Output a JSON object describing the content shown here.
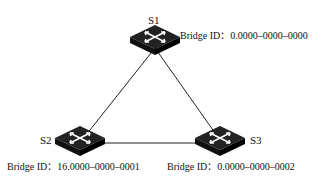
{
  "diagram": {
    "type": "network-topology",
    "switches": [
      {
        "name": "S1",
        "bridge_id_label": "Bridge ID：",
        "bridge_id": "0.0000–0000–0000"
      },
      {
        "name": "S2",
        "bridge_id_label": "Bridge ID：",
        "bridge_id": "16.0000–0000–0001"
      },
      {
        "name": "S3",
        "bridge_id_label": "Bridge ID：",
        "bridge_id": "0.0000–0000–0002"
      }
    ],
    "links": [
      [
        "S1",
        "S2"
      ],
      [
        "S1",
        "S3"
      ],
      [
        "S2",
        "S3"
      ]
    ],
    "icon": "switch-icon"
  }
}
